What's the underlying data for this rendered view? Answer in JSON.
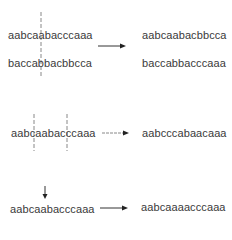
{
  "rows": [
    {
      "operation": "crossover",
      "inputs": [
        "aabcaabacccaaa",
        "baccabbacbbcca"
      ],
      "outputs": [
        "aabcaabacbbcca",
        "baccabbacccaaa"
      ]
    },
    {
      "operation": "inversion",
      "inputs": [
        "aabcaabacccaaa"
      ],
      "outputs": [
        "aabcccabaacaaa"
      ]
    },
    {
      "operation": "mutation",
      "inputs": [
        "aabcaabacccaaa"
      ],
      "outputs": [
        "aabcaaaacccaaa"
      ]
    }
  ],
  "colors": {
    "text": "#3a3a3a",
    "arrow": "#222222",
    "dashed": "#888888"
  }
}
